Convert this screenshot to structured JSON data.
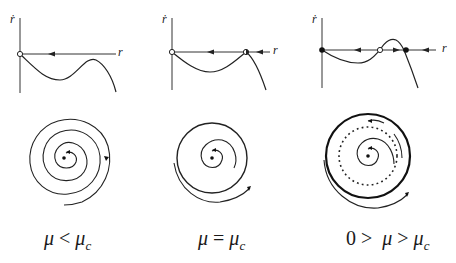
{
  "figure": {
    "top_text": "",
    "panels": [
      {
        "id": "mu-less-than-muc",
        "phase_line": {
          "y_axis_label": "ṙ",
          "x_axis_label": "r",
          "fixed_points": [
            {
              "r": "0",
              "type": "unstable",
              "marker": "open-circle"
            }
          ],
          "flow_arrows": [
            "left"
          ]
        },
        "phase_portrait": {
          "center": "stable-focus",
          "trajectories": "spiral inward toward origin",
          "limit_cycles": []
        },
        "caption": {
          "lhs": "μ",
          "op": "<",
          "rhs": "μ",
          "rhs_sub": "c",
          "prefix": ""
        }
      },
      {
        "id": "mu-equals-muc",
        "phase_line": {
          "y_axis_label": "ṙ",
          "x_axis_label": "r",
          "fixed_points": [
            {
              "r": "0",
              "type": "unstable",
              "marker": "open-circle"
            },
            {
              "r": "r*",
              "type": "half-stable",
              "marker": "half-filled-circle"
            }
          ],
          "flow_arrows": [
            "left",
            "left"
          ]
        },
        "phase_portrait": {
          "center": "stable-focus",
          "trajectories": "spiral inward; semi-stable cycle forms",
          "limit_cycles": [
            {
              "type": "half-stable",
              "style": "solid-thick"
            }
          ]
        },
        "caption": {
          "lhs": "μ",
          "op": "=",
          "rhs": "μ",
          "rhs_sub": "c",
          "prefix": ""
        }
      },
      {
        "id": "zero-greater-mu-greater-muc",
        "phase_line": {
          "y_axis_label": "ṙ",
          "x_axis_label": "r",
          "fixed_points": [
            {
              "r": "0",
              "type": "stable",
              "marker": "filled-circle"
            },
            {
              "r": "r1",
              "type": "unstable",
              "marker": "open-circle"
            },
            {
              "r": "r2",
              "type": "stable",
              "marker": "filled-circle"
            }
          ],
          "flow_arrows": [
            "left",
            "right",
            "left"
          ]
        },
        "phase_portrait": {
          "center": "stable-focus",
          "trajectories": "spiral between cycles",
          "limit_cycles": [
            {
              "type": "unstable",
              "style": "dotted"
            },
            {
              "type": "stable",
              "style": "solid-thick"
            }
          ]
        },
        "caption": {
          "lhs": "μ",
          "op": ">",
          "rhs": "μ",
          "rhs_sub": "c",
          "prefix": "0 >"
        }
      }
    ]
  }
}
